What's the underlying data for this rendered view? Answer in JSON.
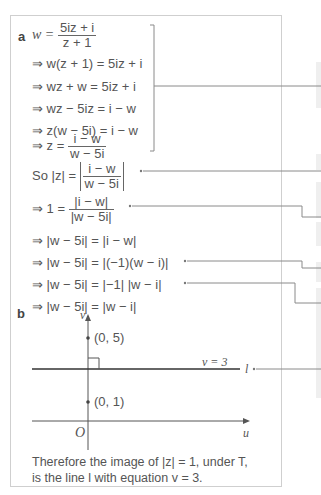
{
  "part_a": {
    "label": "a",
    "lines": [
      {
        "prefix": "w =",
        "frac_num": "5iz + i",
        "frac_den": "z + 1"
      },
      {
        "text": "⇒ w(z + 1) = 5iz + i"
      },
      {
        "text": "⇒ wz + w = 5iz + i"
      },
      {
        "text": "⇒ wz − 5iz = i − w"
      },
      {
        "text": "⇒ z(w − 5i) = i − w"
      },
      {
        "prefix": "⇒ z =",
        "frac_num": "i − w",
        "frac_den": "w − 5i"
      },
      {
        "prefix": "So |z| =",
        "frac_num": "i − w",
        "frac_den": "w − 5i"
      },
      {
        "prefix": "⇒ 1 =",
        "frac_num": "|i − w|",
        "frac_den": "|w − 5i|"
      },
      {
        "text": "⇒ |w − 5i| = |i − w|"
      },
      {
        "text": "⇒ |w − 5i| = |(−1)(w − i)|"
      },
      {
        "text": "⇒ |w − 5i| = |−1| |w − i|"
      },
      {
        "text": "⇒ |w − 5i| = |w − i|"
      }
    ]
  },
  "part_b": {
    "label": "b",
    "axis_v": "v",
    "axis_u": "u",
    "origin": "O",
    "point_top": "(0, 5)",
    "point_bottom": "(0, 1)",
    "line_eq": "v = 3",
    "line_name": "l"
  },
  "conclusion": {
    "line1": "Therefore the image of |z| = 1, under T,",
    "line2": "is the line l with equation v = 3."
  },
  "colors": {
    "border": "#cfcfcf",
    "text": "#555555",
    "connector": "#8a8a8a",
    "side_panel": "#efefef"
  }
}
